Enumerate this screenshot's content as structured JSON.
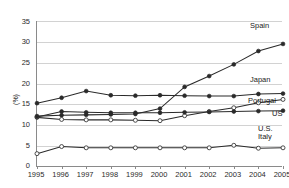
{
  "chart_data": {
    "type": "line",
    "title": "",
    "xlabel": "",
    "ylabel": "(%)",
    "x": [
      1995,
      1996,
      1997,
      1998,
      1999,
      2000,
      2001,
      2002,
      2003,
      2004,
      2005
    ],
    "categories": [
      "1995",
      "1996",
      "1997",
      "1998",
      "1999",
      "2000",
      "2001",
      "2002",
      "2003",
      "2004",
      "2005"
    ],
    "xlim": [
      1995,
      2005
    ],
    "ylim": [
      0,
      35
    ],
    "yticks": [
      0,
      5,
      10,
      15,
      20,
      25,
      30,
      35
    ],
    "grid": true,
    "legend_position": "right-inline-end-of-line",
    "series": [
      {
        "name": "Spain",
        "marker": "filled-circle",
        "values": [
          12.2,
          12.4,
          12.5,
          12.6,
          12.7,
          14.0,
          19.2,
          21.8,
          24.6,
          27.8,
          29.5
        ]
      },
      {
        "name": "Japan",
        "marker": "filled-circle",
        "values": [
          15.3,
          16.6,
          18.2,
          17.2,
          17.1,
          17.2,
          17.1,
          17.0,
          17.0,
          17.5,
          17.6
        ]
      },
      {
        "name": "Portugal",
        "marker": "open-circle",
        "values": [
          11.9,
          11.4,
          11.3,
          11.3,
          11.2,
          11.1,
          12.3,
          13.3,
          14.2,
          15.4,
          16.2
        ]
      },
      {
        "name": "US",
        "marker": "filled-circle",
        "values": [
          12.0,
          13.3,
          13.1,
          13.0,
          13.0,
          13.0,
          13.1,
          13.2,
          13.3,
          13.4,
          13.5
        ]
      },
      {
        "name": "Italy",
        "marker": "open-circle",
        "values": [
          3.2,
          4.9,
          4.6,
          4.6,
          4.6,
          4.6,
          4.6,
          4.6,
          5.2,
          4.5,
          4.6
        ]
      }
    ],
    "series_end_labels": [
      {
        "name": "Spain",
        "text": "Spain"
      },
      {
        "name": "Japan",
        "text": "Japan"
      },
      {
        "name": "Portugal",
        "text": "Portugal"
      },
      {
        "name": "US",
        "text": "US"
      },
      {
        "name": "Italy-upper",
        "text": "U.S."
      },
      {
        "name": "Italy",
        "text": "Italy"
      }
    ],
    "colors": {
      "line": "#2a2a2a",
      "grid": "#d2d2d2",
      "axis": "#8a8a8a",
      "text": "#1a1a1a",
      "background": "#ffffff"
    }
  },
  "labels": {
    "y_axis": "(%)",
    "spain": "Spain",
    "japan": "Japan",
    "portugal": "Portugal",
    "us": "US",
    "us_dot": "U.S.",
    "italy": "Italy",
    "y0": "0",
    "y5": "5",
    "y10": "10",
    "y15": "15",
    "y20": "20",
    "y25": "25",
    "y30": "30",
    "y35": "35",
    "x1995": "1995",
    "x1996": "1996",
    "x1997": "1997",
    "x1998": "1998",
    "x1999": "1999",
    "x2000": "2000",
    "x2001": "2001",
    "x2002": "2002",
    "x2003": "2003",
    "x2004": "2004",
    "x2005": "2005"
  }
}
